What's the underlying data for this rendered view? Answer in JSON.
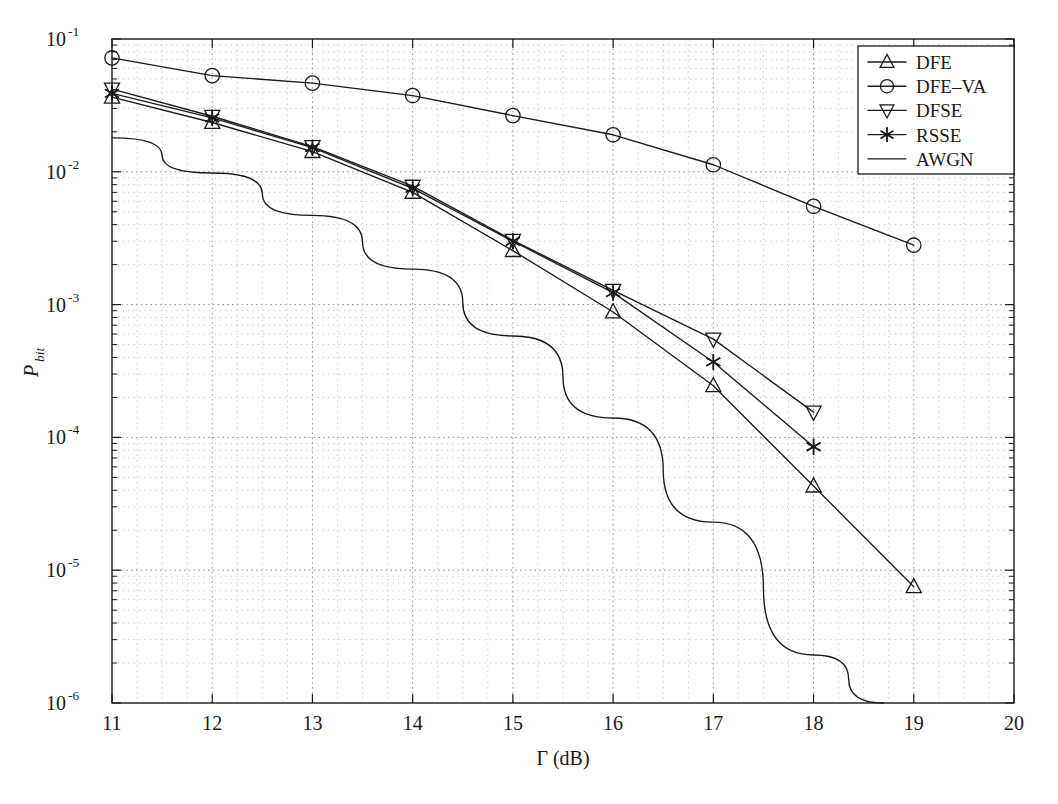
{
  "chart_data": {
    "type": "line",
    "title": "",
    "xlabel": "Γ (dB)",
    "ylabel_base": "P",
    "ylabel_sub": "bit",
    "xlim": [
      11,
      20
    ],
    "ylim": [
      1e-06,
      0.1
    ],
    "yscale": "log",
    "xscale": "linear",
    "grid": true,
    "grid_style": "dotted",
    "legend_position": "upper right",
    "xticks": [
      11,
      12,
      13,
      14,
      15,
      16,
      17,
      18,
      19,
      20
    ],
    "xtick_labels": [
      "11",
      "12",
      "13",
      "14",
      "15",
      "16",
      "17",
      "18",
      "19",
      "20"
    ],
    "yticks": [
      0.1,
      0.01,
      0.001,
      0.0001,
      1e-05,
      1e-06
    ],
    "ytick_labels": [
      "10⁻¹",
      "10⁻²",
      "10⁻³",
      "10⁻⁴",
      "10⁻⁵",
      "10⁻⁶"
    ],
    "ytick_exponents": [
      "-1",
      "-2",
      "-3",
      "-4",
      "-5",
      "-6"
    ],
    "series": [
      {
        "name": "DFE",
        "marker": "triangle-up",
        "x": [
          11,
          12,
          13,
          14,
          15,
          16,
          17,
          18,
          19
        ],
        "values": [
          0.0365,
          0.0235,
          0.0142,
          0.007,
          0.00255,
          0.00088,
          0.000245,
          4.3e-05,
          7.5e-06
        ]
      },
      {
        "name": "DFE-VA",
        "marker": "circle",
        "x": [
          11,
          12,
          13,
          14,
          15,
          16,
          17,
          18,
          19
        ],
        "values": [
          0.072,
          0.053,
          0.0465,
          0.0375,
          0.0265,
          0.019,
          0.0113,
          0.0055,
          0.0028
        ]
      },
      {
        "name": "DFSE",
        "marker": "triangle-down",
        "x": [
          11,
          12,
          13,
          14,
          15,
          16,
          17,
          18
        ],
        "values": [
          0.042,
          0.0262,
          0.0155,
          0.0078,
          0.00305,
          0.00128,
          0.00055,
          0.000155
        ]
      },
      {
        "name": "RSSE",
        "marker": "star",
        "x": [
          11,
          12,
          13,
          14,
          15,
          16,
          17,
          18
        ],
        "values": [
          0.039,
          0.0255,
          0.0152,
          0.0075,
          0.003,
          0.00123,
          0.00037,
          8.5e-05
        ]
      },
      {
        "name": "AWGN",
        "marker": "none",
        "x": [
          11,
          12,
          13,
          14,
          15,
          16,
          17,
          18,
          18.7
        ],
        "values": [
          0.018,
          0.0098,
          0.0047,
          0.00185,
          0.00058,
          0.00014,
          2.3e-05,
          2.3e-06,
          1e-06
        ]
      }
    ],
    "legend_entries": [
      {
        "label": "DFE",
        "marker": "triangle-up"
      },
      {
        "label": "DFE–VA",
        "marker": "circle"
      },
      {
        "label": "DFSE",
        "marker": "triangle-down"
      },
      {
        "label": "RSSE",
        "marker": "star"
      },
      {
        "label": "AWGN",
        "marker": "none"
      }
    ],
    "colors": {
      "line": "#1a1a1a",
      "grid": "#9a9a9a",
      "axis": "#1a1a1a",
      "background": "#ffffff"
    }
  }
}
